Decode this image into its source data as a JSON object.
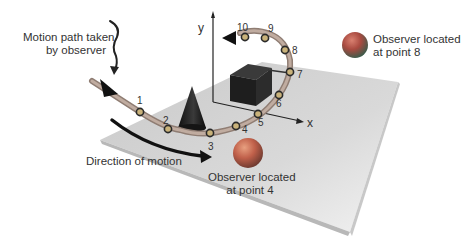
{
  "diagram": {
    "labels": {
      "motion_path": [
        "Motion path taken",
        "by observer"
      ],
      "direction": "Direction of motion",
      "observer_point_8": [
        "Observer located",
        "at point 8"
      ],
      "observer_point_4": [
        "Observer located",
        "at point 4"
      ]
    },
    "axes": {
      "x": "x",
      "y": "y"
    },
    "path_points": [
      "1",
      "2",
      "3",
      "4",
      "5",
      "6",
      "7",
      "8",
      "9",
      "10"
    ],
    "objects": [
      "cone",
      "cube",
      "sphere-point-8",
      "sphere-point-4",
      "ground-plane"
    ],
    "colors": {
      "plane": "#d4d4d4",
      "path": "#a08c80",
      "cube": "#1e1e1e",
      "cone": "#1a1a1a",
      "sphere": "#c0604a",
      "arrow": "#111111",
      "text": "#333333"
    }
  }
}
